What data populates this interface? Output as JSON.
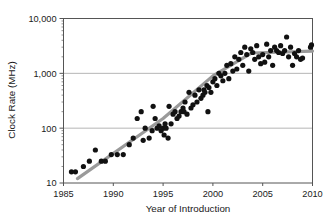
{
  "chart_data": {
    "type": "scatter",
    "title": "",
    "xlabel": "Year of Introduction",
    "ylabel": "Clock Rate (MHz)",
    "xlim": [
      1985,
      2010
    ],
    "ylim": [
      10,
      10000
    ],
    "yscale": "log",
    "grid": "horizontal-major",
    "legend": "none",
    "xticks": [
      "1985",
      "1990",
      "1995",
      "2000",
      "2005",
      "2010"
    ],
    "xtick_values": [
      1985,
      1990,
      1995,
      2000,
      2005,
      2010
    ],
    "yticks": [
      "10",
      "100",
      "1,000",
      "10,000"
    ],
    "ytick_values": [
      10,
      100,
      1000,
      10000
    ],
    "marker": {
      "shape": "circle",
      "color": "#111111",
      "size": 2.6
    },
    "trendline": {
      "name": "trend",
      "color": "#9a9a9a",
      "width": 3.2,
      "points": [
        [
          1986.4,
          12
        ],
        [
          1995.0,
          150
        ],
        [
          2000.0,
          900
        ],
        [
          2003.9,
          2350
        ],
        [
          2010.0,
          2550
        ]
      ]
    },
    "series": [
      {
        "name": "Clock Rate",
        "points": [
          [
            1985.8,
            16
          ],
          [
            1986.2,
            16
          ],
          [
            1987.0,
            20
          ],
          [
            1987.6,
            25
          ],
          [
            1988.2,
            40
          ],
          [
            1988.8,
            25
          ],
          [
            1989.2,
            25
          ],
          [
            1989.8,
            33
          ],
          [
            1990.4,
            33
          ],
          [
            1991.0,
            33
          ],
          [
            1991.6,
            50
          ],
          [
            1992.0,
            66
          ],
          [
            1992.4,
            150
          ],
          [
            1992.8,
            200
          ],
          [
            1993.0,
            60
          ],
          [
            1993.2,
            100
          ],
          [
            1993.6,
            66
          ],
          [
            1993.9,
            90
          ],
          [
            1994.0,
            250
          ],
          [
            1994.2,
            150
          ],
          [
            1994.4,
            100
          ],
          [
            1994.6,
            110
          ],
          [
            1994.8,
            90
          ],
          [
            1995.0,
            100
          ],
          [
            1995.1,
            75
          ],
          [
            1995.2,
            120
          ],
          [
            1995.3,
            100
          ],
          [
            1995.5,
            66
          ],
          [
            1995.6,
            250
          ],
          [
            1995.8,
            120
          ],
          [
            1996.0,
            180
          ],
          [
            1996.2,
            200
          ],
          [
            1996.4,
            150
          ],
          [
            1996.6,
            166
          ],
          [
            1996.8,
            200
          ],
          [
            1997.0,
            233
          ],
          [
            1997.1,
            200
          ],
          [
            1997.2,
            300
          ],
          [
            1997.4,
            180
          ],
          [
            1997.6,
            450
          ],
          [
            1997.8,
            233
          ],
          [
            1998.0,
            266
          ],
          [
            1998.2,
            400
          ],
          [
            1998.4,
            300
          ],
          [
            1998.6,
            500
          ],
          [
            1998.8,
            350
          ],
          [
            1999.0,
            400
          ],
          [
            1999.1,
            500
          ],
          [
            1999.2,
            450
          ],
          [
            1999.4,
            600
          ],
          [
            1999.5,
            200
          ],
          [
            1999.6,
            550
          ],
          [
            1999.8,
            450
          ],
          [
            2000.0,
            700
          ],
          [
            2000.2,
            800
          ],
          [
            2000.4,
            600
          ],
          [
            2000.6,
            1000
          ],
          [
            2000.8,
            900
          ],
          [
            2001.0,
            733
          ],
          [
            2001.2,
            1000
          ],
          [
            2001.4,
            1400
          ],
          [
            2001.6,
            800
          ],
          [
            2001.8,
            1500
          ],
          [
            2002.0,
            1100
          ],
          [
            2002.2,
            2000
          ],
          [
            2002.4,
            1200
          ],
          [
            2002.6,
            1800
          ],
          [
            2002.8,
            2400
          ],
          [
            2003.0,
            1400
          ],
          [
            2003.2,
            3000
          ],
          [
            2003.4,
            2200
          ],
          [
            2003.6,
            1100
          ],
          [
            2003.8,
            2800
          ],
          [
            2004.0,
            2400
          ],
          [
            2004.2,
            1800
          ],
          [
            2004.4,
            3200
          ],
          [
            2004.6,
            2000
          ],
          [
            2004.8,
            1500
          ],
          [
            2005.0,
            2200
          ],
          [
            2005.2,
            1600
          ],
          [
            2005.4,
            3400
          ],
          [
            2005.6,
            2000
          ],
          [
            2005.8,
            2600
          ],
          [
            2006.0,
            1400
          ],
          [
            2006.2,
            3000
          ],
          [
            2006.4,
            2600
          ],
          [
            2006.6,
            2400
          ],
          [
            2006.8,
            3200
          ],
          [
            2007.0,
            2300
          ],
          [
            2007.2,
            2600
          ],
          [
            2007.4,
            4600
          ],
          [
            2007.6,
            2000
          ],
          [
            2007.8,
            3000
          ],
          [
            2008.0,
            1400
          ],
          [
            2008.2,
            2300
          ],
          [
            2008.4,
            2000
          ],
          [
            2008.6,
            2600
          ],
          [
            2008.8,
            1800
          ],
          [
            2009.0,
            1900
          ],
          [
            2009.8,
            3000
          ],
          [
            2009.9,
            3300
          ]
        ]
      }
    ]
  },
  "axes": {
    "y_title": "Clock Rate (MHz)",
    "x_title": "Year of Introduction",
    "y_labels": [
      "10,000",
      "1,000",
      "100",
      "10"
    ],
    "x_labels": [
      "1985",
      "1990",
      "1995",
      "2000",
      "2005",
      "2010"
    ]
  },
  "colors": {
    "marker": "#111111",
    "trendline": "#9a9a9a",
    "gridline": "#b5b5b5",
    "frame": "#555555",
    "text": "#1a1a1a"
  }
}
